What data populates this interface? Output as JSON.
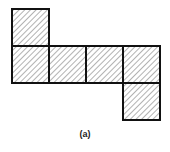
{
  "diagram": {
    "cell_size": 37,
    "origin": {
      "x": 12,
      "y": 9
    },
    "cells": [
      {
        "col": 0,
        "row": 0
      },
      {
        "col": 0,
        "row": 1
      },
      {
        "col": 1,
        "row": 1
      },
      {
        "col": 2,
        "row": 1
      },
      {
        "col": 3,
        "row": 1
      },
      {
        "col": 3,
        "row": 2
      }
    ],
    "fill_pattern": "diagonal-hatch",
    "stroke_color": "#111111",
    "hatch_color": "#555555"
  },
  "caption": "(a)"
}
